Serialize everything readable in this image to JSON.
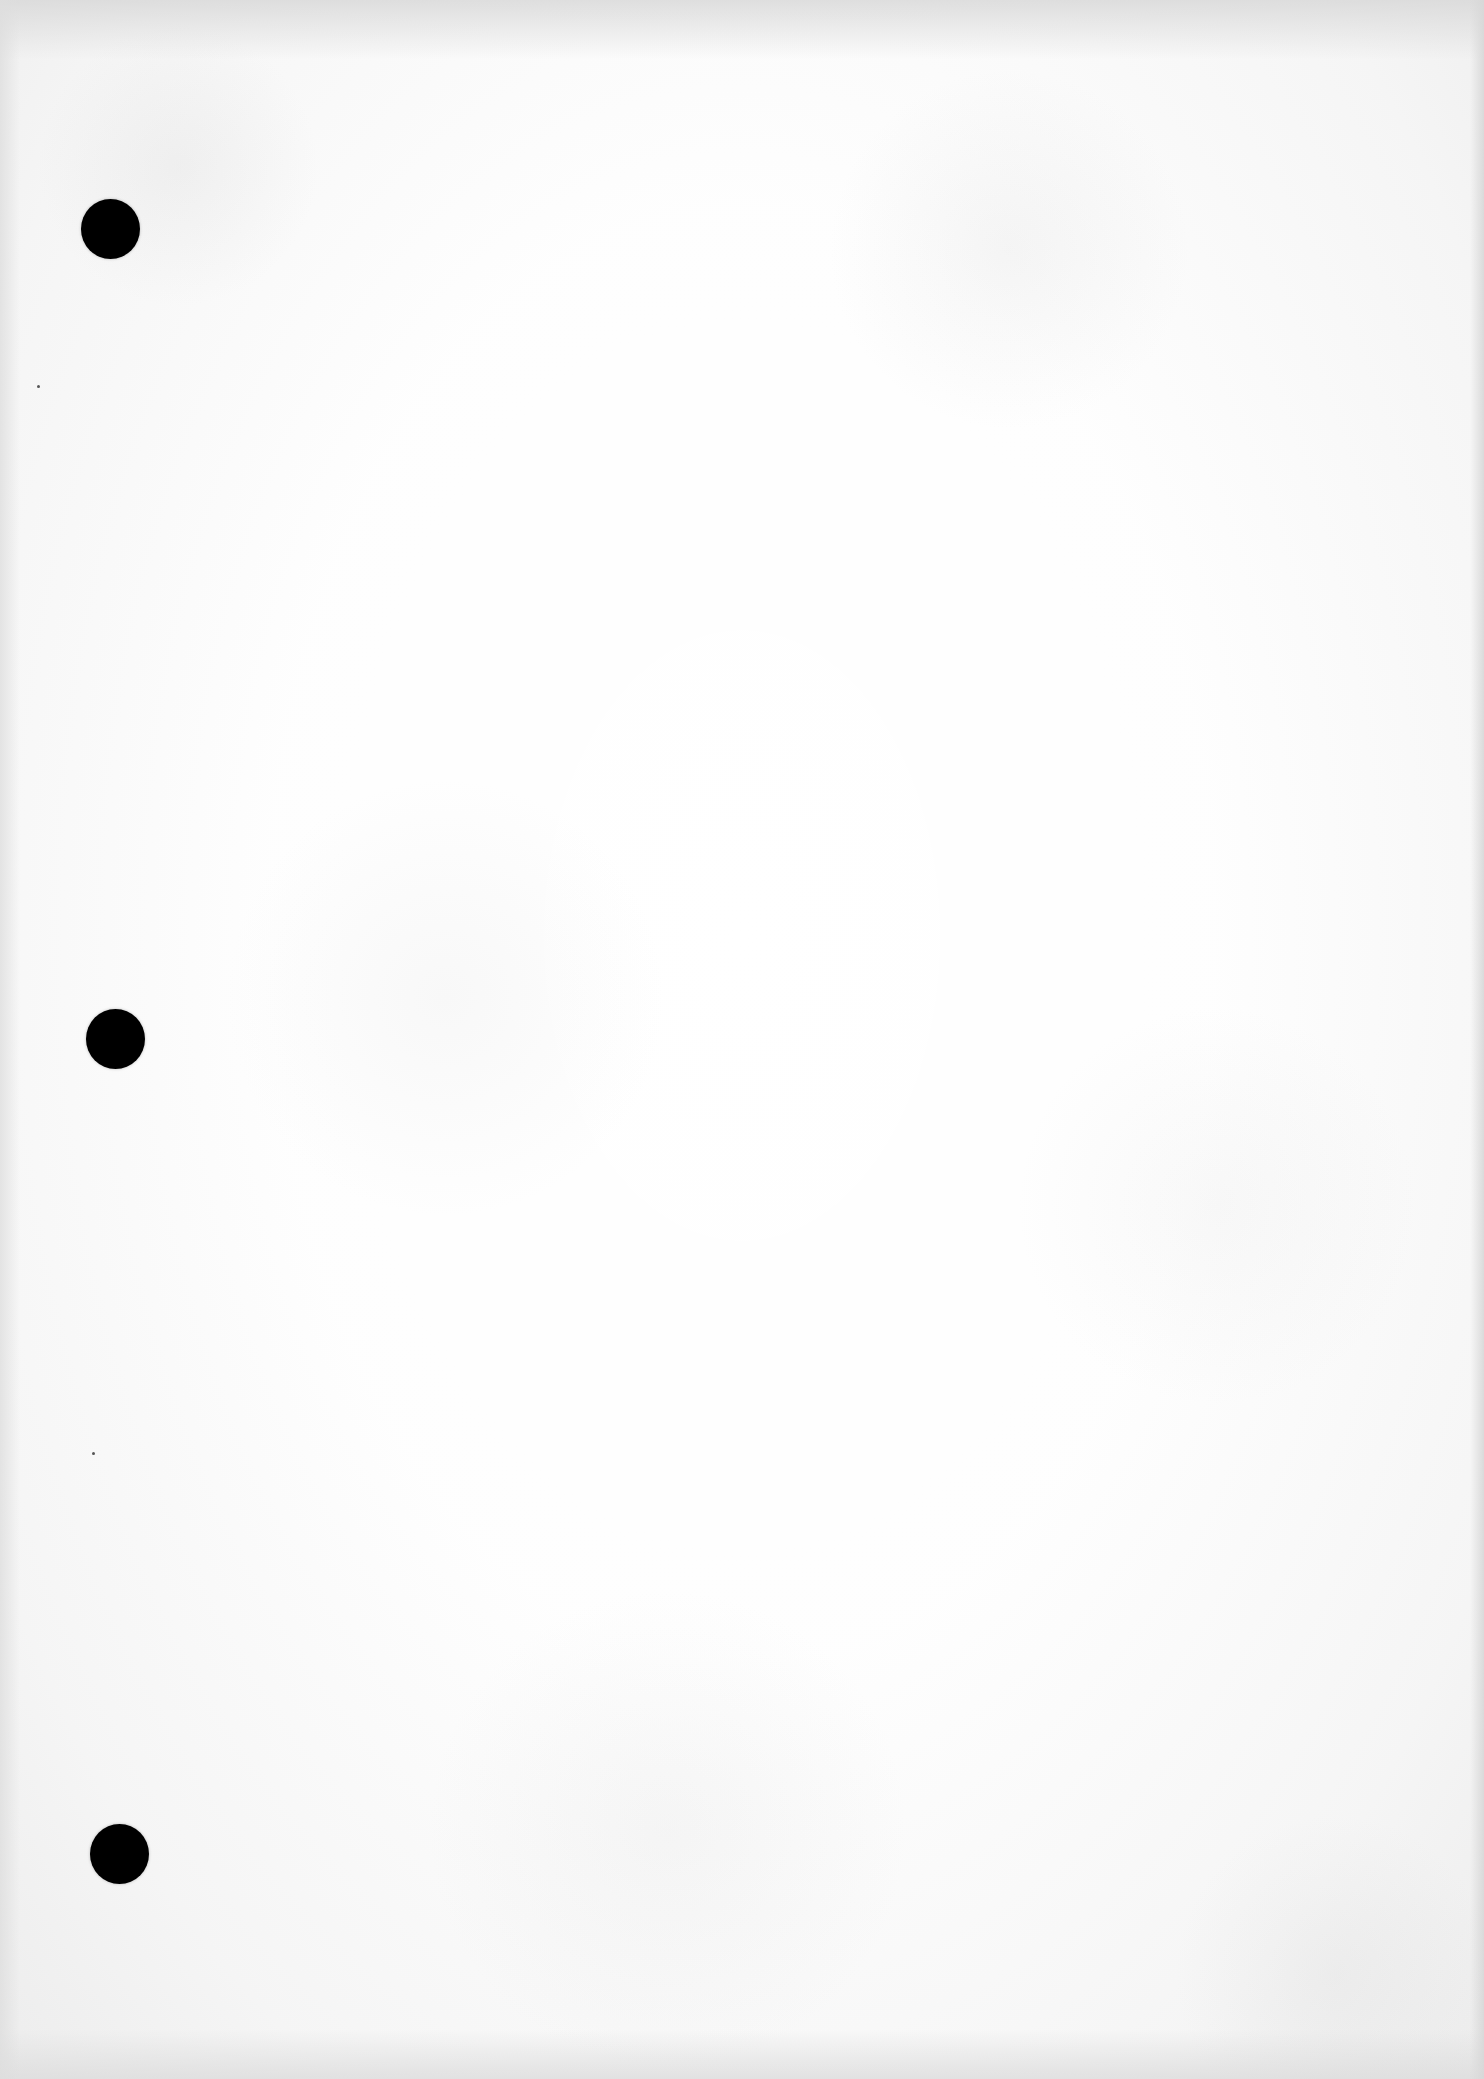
{
  "document": {
    "type": "blank 3-hole punched paper",
    "text_content": "",
    "paper_color": "#f7f7f7",
    "hole_color": "#000000"
  },
  "punch_holes": [
    {
      "label": "top-hole",
      "cx": 110,
      "cy": 229,
      "diameter": 59
    },
    {
      "label": "middle-hole",
      "cx": 115,
      "cy": 1039,
      "diameter": 59
    },
    {
      "label": "bottom-hole",
      "cx": 120,
      "cy": 1854,
      "diameter": 59
    }
  ],
  "specks": [
    {
      "x": 38,
      "y": 386
    },
    {
      "x": 93,
      "y": 1453
    }
  ]
}
